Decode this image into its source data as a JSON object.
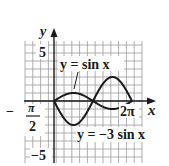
{
  "chart_data": {
    "type": "line",
    "title": "",
    "xlabel": "x",
    "ylabel": "y",
    "xlim": [
      -0.9,
      2.3
    ],
    "ylim": [
      -7.5,
      7.5
    ],
    "grid": true,
    "x_tick_labels": [
      "-π/2",
      "2π"
    ],
    "y_tick_labels": [
      "5",
      "-5"
    ],
    "series": [
      {
        "name": "y = sin x",
        "function": "sin(x)",
        "domain": [
          0,
          6.2832
        ],
        "amplitude": 1
      },
      {
        "name": "y = −3 sin x",
        "function": "-3*sin(x)",
        "domain": [
          0,
          6.2832
        ],
        "amplitude": 3
      }
    ],
    "annotations": [
      {
        "text": "y = sin x",
        "points_to": "sin(x) near x=π/2"
      },
      {
        "text": "y = −3 sin x",
        "position": "below curves, right side"
      }
    ]
  },
  "labels": {
    "x_axis": "x",
    "y_axis": "y",
    "y_top": "5",
    "y_bottom": "−5",
    "x_left_minus": "−",
    "x_left_num": "π",
    "x_left_den": "2",
    "x_right": "2π",
    "curve1": "y = sin x",
    "curve2": "y = −3 sin x"
  },
  "colors": {
    "curve": "#1a1a1a",
    "grid": "#9a9a9a",
    "axis": "#1a1a1a"
  }
}
